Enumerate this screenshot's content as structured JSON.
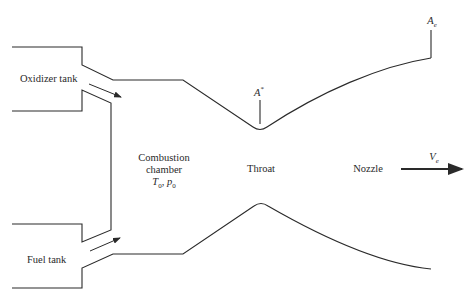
{
  "diagram": {
    "type": "rocket-engine-schematic",
    "labels": {
      "oxidizer_tank": "Oxidizer tank",
      "fuel_tank": "Fuel tank",
      "combustion_line1": "Combustion",
      "combustion_line2": "chamber",
      "chamber_T": "T",
      "chamber_T_sub": "0",
      "chamber_sep": ", ",
      "chamber_p": "p",
      "chamber_p_sub": "0",
      "throat": "Throat",
      "nozzle": "Nozzle",
      "throat_area": "A",
      "throat_area_sup": "*",
      "exit_area": "A",
      "exit_area_sub": "e",
      "exit_velocity": "V",
      "exit_velocity_sub": "e"
    },
    "colors": {
      "line": "#2a2a2a",
      "background": "#ffffff"
    }
  }
}
